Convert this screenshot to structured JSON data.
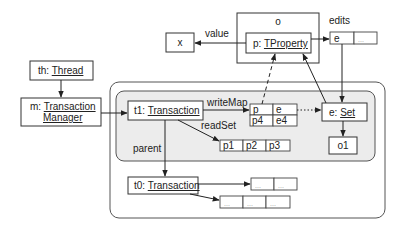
{
  "diagram": {
    "type": "object-reference-diagram",
    "colors": {
      "outer_region_fill": "#ffffff",
      "inner_region_fill": "#ececec",
      "stroke": "#333333"
    },
    "nodes": {
      "o": {
        "label": "o"
      },
      "tproperty": {
        "prefix": "p: ",
        "type": "TProperty"
      },
      "x": {
        "label": "x"
      },
      "thread": {
        "prefix": "th: ",
        "type": "Thread"
      },
      "manager": {
        "prefix": "m: ",
        "type_line1": "Transaction",
        "type_line2": "Manager"
      },
      "t1": {
        "prefix": "t1: ",
        "type": "Transaction"
      },
      "t0": {
        "prefix": "t0: ",
        "type": "Transaction"
      },
      "eset": {
        "prefix": "e: ",
        "type": "Set"
      },
      "o1": {
        "label": "o1"
      }
    },
    "tables": {
      "edits": [
        "e",
        "..."
      ],
      "writeMap": [
        [
          "p",
          "e"
        ],
        [
          "p4",
          "e4"
        ]
      ],
      "readSet": [
        "p1",
        "p2",
        "p3"
      ],
      "t0_array1": [
        "...",
        "..."
      ],
      "t0_array2": [
        "...",
        "...",
        "..."
      ]
    },
    "edge_labels": {
      "value": "value",
      "edits": "edits",
      "writeMap": "writeMap",
      "readSet": "readSet",
      "parent": "parent"
    }
  }
}
